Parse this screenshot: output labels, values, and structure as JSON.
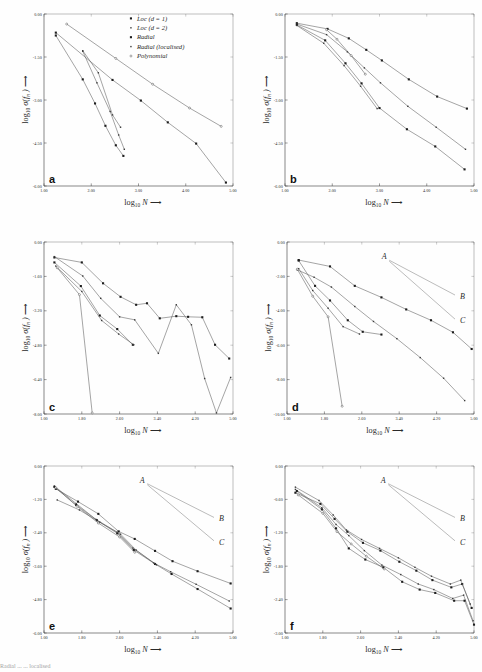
{
  "figure": {
    "axis_x_label_main": "log",
    "axis_x_label_sub": "10",
    "axis_x_label_var": "N",
    "axis_y_label_main": "log",
    "axis_y_label_sub": "10",
    "axis_y_label_sigma": "σ(",
    "axis_y_label_var": "f",
    "axis_y_label_var_sub": "n",
    "axis_y_label_close": ")",
    "arrow": "⟶"
  },
  "legend": {
    "entries": [
      {
        "label": "Loc (d = 1)",
        "marker": "dot-small"
      },
      {
        "label": "Loc (d = 2)",
        "marker": "dot-open"
      },
      {
        "label": "Radial",
        "marker": "square-filled"
      },
      {
        "label": "Radial (localised)",
        "marker": "dot-small"
      },
      {
        "label": "Polynomial",
        "marker": "dot-small"
      }
    ]
  },
  "annotations": {
    "a": "A",
    "b": "B",
    "c": "C"
  },
  "caption": "Radial ... ... localised",
  "chart_data": [
    {
      "type": "line",
      "panel": "a",
      "title": "",
      "xlabel": "log10 N",
      "ylabel": "log10 sigma(f_n)",
      "xlim": [
        1.0,
        5.0
      ],
      "ylim": [
        -6.0,
        0.0
      ],
      "xticks": [
        "1.00",
        "2.00",
        "3.00",
        "4.00",
        "5.00"
      ],
      "yticks": [
        "0.00",
        "-1.50",
        "-3.00",
        "-4.50",
        "-6.00"
      ],
      "grid": false,
      "legend_position": "top-right",
      "series": [
        {
          "name": "Loc (d = 1)",
          "x": [
            1.25,
            2.45,
            3.05,
            3.62,
            4.22,
            4.85
          ],
          "y": [
            -0.65,
            -2.3,
            -3.02,
            -3.78,
            -4.52,
            -5.88
          ]
        },
        {
          "name": "Loc (d = 2)",
          "x": [
            1.82,
            2.15,
            2.45,
            2.62
          ],
          "y": [
            -1.28,
            -2.05,
            -3.52,
            -3.95
          ]
        },
        {
          "name": "Radial",
          "x": [
            1.25,
            1.82,
            2.08,
            2.3,
            2.52,
            2.68
          ],
          "y": [
            -0.75,
            -2.28,
            -3.12,
            -3.9,
            -4.58,
            -4.95
          ]
        },
        {
          "name": "Radial (localised)",
          "x": [
            1.82,
            2.12,
            2.4,
            2.58,
            2.7
          ],
          "y": [
            -1.3,
            -2.4,
            -3.4,
            -4.22,
            -4.72
          ]
        },
        {
          "name": "Polynomial",
          "x": [
            1.48,
            2.52,
            3.3,
            4.08,
            4.75
          ],
          "y": [
            -0.35,
            -1.55,
            -2.45,
            -3.28,
            -3.92
          ]
        }
      ]
    },
    {
      "type": "line",
      "panel": "b",
      "xlim": [
        1.0,
        5.0
      ],
      "ylim": [
        -6.0,
        0.0
      ],
      "xticks": [
        "1.00",
        "2.00",
        "3.00",
        "4.00",
        "5.00"
      ],
      "yticks": [
        "0.00",
        "-1.50",
        "-3.00",
        "-4.50",
        "-6.00"
      ],
      "grid": false,
      "series": [
        {
          "name": "curve-1",
          "x": [
            1.25,
            1.9,
            2.35,
            2.72,
            3.05,
            3.62,
            4.22,
            4.85
          ],
          "y": [
            -0.32,
            -0.52,
            -0.85,
            -1.25,
            -1.62,
            -2.28,
            -2.88,
            -3.3
          ]
        },
        {
          "name": "curve-2",
          "x": [
            1.25,
            1.88,
            2.32,
            2.68,
            3.02,
            3.6,
            4.2,
            4.82
          ],
          "y": [
            -0.35,
            -0.72,
            -1.32,
            -1.88,
            -2.4,
            -3.22,
            -3.95,
            -4.72
          ]
        },
        {
          "name": "curve-3",
          "x": [
            1.25,
            1.85,
            2.28,
            2.62,
            3.0,
            3.58,
            4.18,
            4.8
          ],
          "y": [
            -0.38,
            -0.92,
            -1.72,
            -2.42,
            -3.28,
            -4.02,
            -4.62,
            -5.42
          ]
        },
        {
          "name": "curve-4",
          "x": [
            1.25,
            1.82,
            2.25,
            2.6,
            2.95
          ],
          "y": [
            -0.4,
            -1.02,
            -1.8,
            -2.52,
            -3.3
          ]
        },
        {
          "name": "curve-5",
          "x": [
            1.88,
            2.1,
            2.4,
            2.7
          ],
          "y": [
            -0.55,
            -0.88,
            -1.45,
            -2.1
          ]
        }
      ]
    },
    {
      "type": "line",
      "panel": "c",
      "xlim": [
        1.0,
        5.0
      ],
      "ylim": [
        -8.0,
        0.0
      ],
      "xticks": [
        "1.00",
        "1.80",
        "2.60",
        "3.40",
        "4.20",
        "5.00"
      ],
      "yticks": [
        "0.00",
        "-1.60",
        "-3.20",
        "-4.80",
        "-6.40",
        "-8.00"
      ],
      "grid": false,
      "series": [
        {
          "name": "curve-1",
          "x": [
            1.22,
            1.8,
            2.25,
            2.62,
            2.95,
            3.18,
            3.45,
            3.8,
            4.05,
            4.35,
            4.62,
            4.92
          ],
          "y": [
            -0.72,
            -0.95,
            -1.92,
            -2.55,
            -2.92,
            -2.85,
            -3.55,
            -3.45,
            -3.48,
            -3.5,
            -4.78,
            -5.42
          ]
        },
        {
          "name": "curve-2",
          "x": [
            1.22,
            1.82,
            2.2,
            2.6,
            2.92,
            3.42,
            3.8,
            4.12,
            4.4,
            4.65,
            4.95
          ],
          "y": [
            -0.68,
            -1.58,
            -2.62,
            -3.48,
            -3.62,
            -5.18,
            -2.92,
            -3.85,
            -6.35,
            -7.95,
            -6.3
          ]
        },
        {
          "name": "curve-3",
          "x": [
            1.22,
            1.78,
            2.18,
            2.55,
            2.88
          ],
          "y": [
            -0.95,
            -2.05,
            -3.42,
            -4.05,
            -4.78
          ]
        },
        {
          "name": "curve-4",
          "x": [
            1.25,
            1.8,
            2.22,
            2.58,
            2.9
          ],
          "y": [
            -1.12,
            -2.3,
            -3.65,
            -4.28,
            -4.78
          ]
        },
        {
          "name": "curve-5",
          "x": [
            1.28,
            1.75,
            2.02
          ],
          "y": [
            -1.2,
            -2.45,
            -7.95
          ]
        }
      ]
    },
    {
      "type": "line",
      "panel": "d",
      "xlim": [
        1.0,
        5.0
      ],
      "ylim": [
        -10.0,
        0.0
      ],
      "xticks": [
        "1.00",
        "1.80",
        "2.60",
        "3.40",
        "4.20",
        "5.00"
      ],
      "yticks": [
        "0.00",
        "-2.00",
        "-4.00",
        "-6.00",
        "-8.00",
        "-10.00"
      ],
      "grid": false,
      "annotations": [
        "A",
        "B",
        "C"
      ],
      "series": [
        {
          "name": "curve-A",
          "x": [
            1.25,
            1.92,
            2.45,
            3.02,
            3.55,
            4.08,
            4.55,
            4.95
          ],
          "y": [
            -1.05,
            -1.42,
            -2.55,
            -3.22,
            -3.92,
            -4.55,
            -5.25,
            -6.22
          ]
        },
        {
          "name": "curve-B",
          "x": [
            1.22,
            1.58,
            1.95,
            2.45,
            2.85,
            3.35,
            3.85,
            4.35,
            4.8
          ],
          "y": [
            -1.62,
            -2.05,
            -2.62,
            -3.75,
            -4.62,
            -5.62,
            -6.72,
            -7.92,
            -9.22
          ]
        },
        {
          "name": "curve-C",
          "x": [
            1.25,
            1.6,
            1.92,
            2.3,
            2.62,
            3.02
          ],
          "y": [
            -1.08,
            -2.55,
            -3.4,
            -4.55,
            -5.22,
            -5.38
          ]
        },
        {
          "name": "curve-D",
          "x": [
            1.25,
            1.55,
            1.88,
            2.2,
            2.55
          ],
          "y": [
            -1.55,
            -2.82,
            -3.85,
            -4.92,
            -5.35
          ]
        },
        {
          "name": "curve-E",
          "x": [
            1.22,
            1.55,
            1.88,
            2.18
          ],
          "y": [
            -1.58,
            -3.15,
            -4.35,
            -9.55
          ]
        }
      ]
    },
    {
      "type": "line",
      "panel": "e",
      "xlim": [
        1.0,
        5.0
      ],
      "ylim": [
        -6.0,
        0.0
      ],
      "xticks": [
        "1.00",
        "1.80",
        "2.60",
        "3.40",
        "4.20",
        "5.00"
      ],
      "yticks": [
        "0.00",
        "-1.20",
        "-2.40",
        "-3.60",
        "-4.80",
        "-6.00"
      ],
      "grid": false,
      "annotations": [
        "A",
        "B",
        "C"
      ],
      "series": [
        {
          "name": "curve-A",
          "x": [
            1.25,
            1.72,
            2.15,
            2.58,
            2.92,
            3.35,
            3.72,
            4.25,
            4.95
          ],
          "y": [
            -0.82,
            -1.28,
            -1.72,
            -2.35,
            -2.62,
            -3.05,
            -3.42,
            -3.78,
            -4.22
          ]
        },
        {
          "name": "curve-B",
          "x": [
            1.22,
            1.68,
            2.1,
            2.55,
            2.88,
            3.32,
            3.68,
            4.22,
            4.92
          ],
          "y": [
            -0.72,
            -1.35,
            -1.92,
            -2.38,
            -2.95,
            -3.48,
            -3.8,
            -4.25,
            -4.85
          ]
        },
        {
          "name": "curve-C",
          "x": [
            1.22,
            1.68,
            2.12,
            2.55,
            2.9,
            3.35,
            3.7,
            4.25,
            4.95
          ],
          "y": [
            -0.75,
            -1.4,
            -1.95,
            -2.42,
            -3.02,
            -3.52,
            -3.88,
            -4.42,
            -5.12
          ]
        },
        {
          "name": "curve-D",
          "x": [
            1.28,
            1.75,
            2.18,
            2.62,
            2.95,
            3.38
          ],
          "y": [
            -1.22,
            -1.58,
            -2.02,
            -2.45,
            -3.02,
            -3.55
          ]
        },
        {
          "name": "curve-E",
          "x": [
            1.25,
            1.7,
            2.15,
            2.6,
            2.92
          ],
          "y": [
            -0.78,
            -1.45,
            -2.05,
            -2.55,
            -3.1
          ]
        }
      ]
    },
    {
      "type": "line",
      "panel": "f",
      "xlim": [
        1.0,
        5.0
      ],
      "ylim": [
        -3.0,
        0.0
      ],
      "xticks": [
        "1.00",
        "1.80",
        "2.60",
        "3.40",
        "4.20",
        "5.00"
      ],
      "yticks": [
        "0.00",
        "-0.60",
        "-1.20",
        "-1.80",
        "-2.40",
        "-3.00"
      ],
      "grid": false,
      "annotations": [
        "A",
        "B",
        "C"
      ],
      "series": [
        {
          "name": "curve-A",
          "x": [
            1.22,
            1.75,
            2.05,
            2.32,
            2.65,
            3.02,
            3.42,
            3.78,
            4.12,
            4.52,
            4.75,
            4.95
          ],
          "y": [
            -0.48,
            -0.68,
            -0.95,
            -1.18,
            -1.38,
            -1.52,
            -1.72,
            -1.88,
            -2.05,
            -2.18,
            -2.12,
            -2.55
          ]
        },
        {
          "name": "curve-B",
          "x": [
            1.22,
            1.78,
            2.08,
            2.35,
            2.68,
            3.05,
            3.45,
            3.82,
            4.15,
            4.55,
            4.78,
            4.98
          ],
          "y": [
            -0.42,
            -0.75,
            -1.05,
            -1.25,
            -1.52,
            -1.78,
            -1.95,
            -2.12,
            -2.22,
            -2.38,
            -2.32,
            -2.78
          ]
        },
        {
          "name": "curve-C",
          "x": [
            1.25,
            1.78,
            2.08,
            2.35,
            2.7,
            3.08,
            3.48,
            3.85,
            4.18,
            4.58,
            4.8,
            5.0
          ],
          "y": [
            -0.45,
            -0.78,
            -1.12,
            -1.48,
            -1.68,
            -1.82,
            -2.08,
            -2.22,
            -2.28,
            -2.42,
            -2.42,
            -2.85
          ]
        },
        {
          "name": "curve-D",
          "x": [
            1.22,
            1.72,
            2.02,
            2.3,
            2.62,
            3.0,
            3.4,
            3.75,
            4.1,
            4.5,
            4.72,
            4.92
          ],
          "y": [
            -0.38,
            -0.62,
            -0.88,
            -1.15,
            -1.32,
            -1.48,
            -1.65,
            -1.82,
            -1.98,
            -2.12,
            -2.05,
            -2.48
          ]
        },
        {
          "name": "curve-E",
          "x": [
            1.28,
            1.8,
            2.1,
            2.4,
            2.72,
            3.1
          ],
          "y": [
            -0.52,
            -0.85,
            -1.18,
            -1.4,
            -1.62,
            -1.85
          ]
        }
      ]
    }
  ]
}
